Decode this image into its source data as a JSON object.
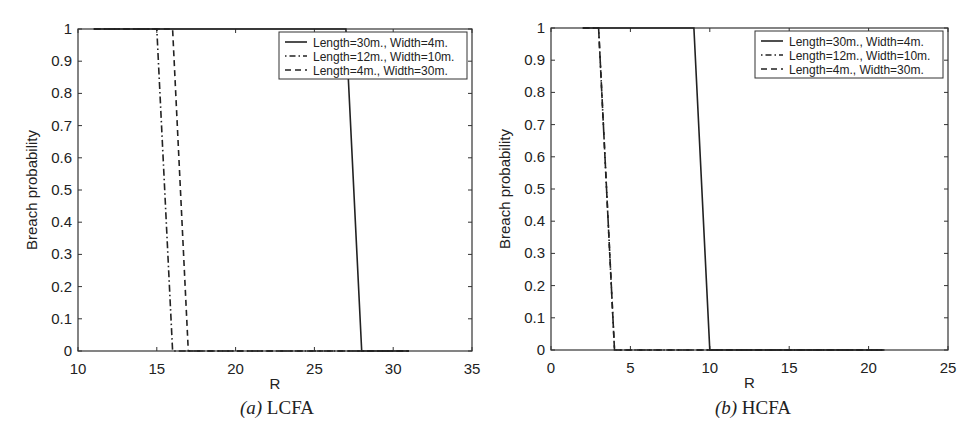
{
  "chart_data": [
    {
      "type": "line",
      "panel": "a",
      "caption_label": "(a)",
      "caption_text": "LCFA",
      "title": "",
      "xlabel": "R",
      "ylabel": "Breach probability",
      "xlim": [
        10,
        35
      ],
      "ylim": [
        0,
        1
      ],
      "xticks": [
        10,
        15,
        20,
        25,
        30,
        35
      ],
      "yticks": [
        0,
        0.1,
        0.2,
        0.3,
        0.4,
        0.5,
        0.6,
        0.7,
        0.8,
        0.9,
        1
      ],
      "ytick_labels": [
        "0",
        "0.1",
        "0.2",
        "0.3",
        "0.4",
        "0.5",
        "0.6",
        "0.7",
        "0.8",
        "0.9",
        "1"
      ],
      "grid": false,
      "legend_position": "upper right",
      "series": [
        {
          "name": "Length=30m., Width=4m.",
          "style": "solid",
          "x": [
            11,
            27,
            28,
            31
          ],
          "y": [
            1,
            1,
            0,
            0
          ]
        },
        {
          "name": "Length=12m., Width=10m.",
          "style": "dashdot",
          "x": [
            11,
            15,
            16,
            31
          ],
          "y": [
            1,
            1,
            0,
            0
          ]
        },
        {
          "name": "Length=4m., Width=30m.",
          "style": "dashed",
          "x": [
            11,
            16,
            17,
            31
          ],
          "y": [
            1,
            1,
            0,
            0
          ]
        }
      ]
    },
    {
      "type": "line",
      "panel": "b",
      "caption_label": "(b)",
      "caption_text": "HCFA",
      "title": "",
      "xlabel": "R",
      "ylabel": "Breach probability",
      "xlim": [
        0,
        25
      ],
      "ylim": [
        0,
        1
      ],
      "xticks": [
        0,
        5,
        10,
        15,
        20,
        25
      ],
      "yticks": [
        0,
        0.1,
        0.2,
        0.3,
        0.4,
        0.5,
        0.6,
        0.7,
        0.8,
        0.9,
        1
      ],
      "ytick_labels": [
        "0",
        "0.1",
        "0.2",
        "0.3",
        "0.4",
        "0.5",
        "0.6",
        "0.7",
        "0.8",
        "0.9",
        "1"
      ],
      "grid": false,
      "legend_position": "upper right",
      "series": [
        {
          "name": "Length=30m., Width=4m.",
          "style": "solid",
          "x": [
            2,
            9,
            10,
            21
          ],
          "y": [
            1,
            1,
            0,
            0
          ]
        },
        {
          "name": "Length=12m., Width=10m.",
          "style": "dashdot",
          "x": [
            2,
            3,
            4,
            21
          ],
          "y": [
            1,
            1,
            0,
            0
          ]
        },
        {
          "name": "Length=4m., Width=30m.",
          "style": "dashed",
          "x": [
            2,
            3,
            4,
            21
          ],
          "y": [
            1,
            1,
            0,
            0
          ]
        }
      ]
    }
  ],
  "captions": [
    {
      "label": "(a)",
      "text": "LCFA"
    },
    {
      "label": "(b)",
      "text": "HCFA"
    }
  ],
  "colors": {
    "line": "#222222",
    "axis": "#333333",
    "background": "#ffffff"
  }
}
